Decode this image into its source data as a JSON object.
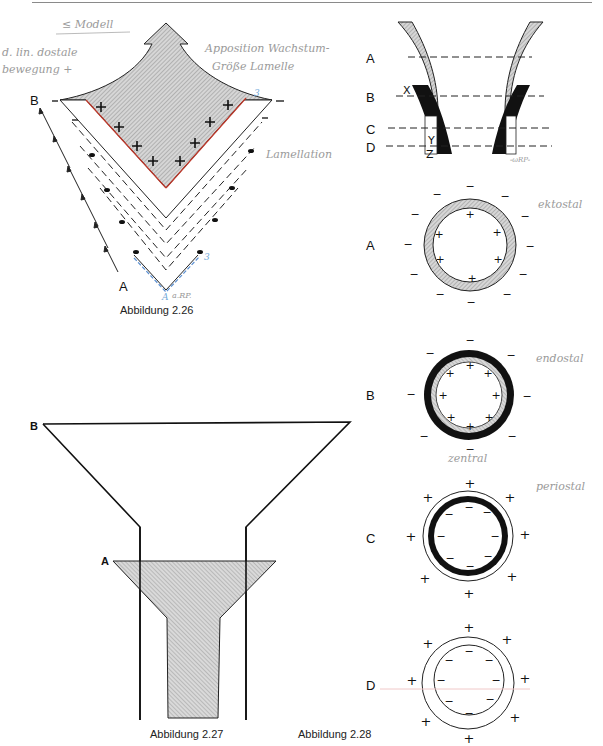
{
  "page": {
    "type": "textbook page scan with handwritten annotations"
  },
  "figure_2_26": {
    "caption": "Abbildung 2.26",
    "labels": {
      "top": "B",
      "bottom": "A"
    },
    "handwritten": {
      "title": "≤ Modell",
      "left_note_line1": "d. lin. dostale",
      "left_note_line2": "bewegung +",
      "right_note_line1": "Apposition Wachstum-",
      "right_note_line2": "Größe Lamelle",
      "side_note": "Lamellation",
      "blue_marks": [
        "3",
        "3",
        "A"
      ],
      "signature": "a.RP."
    },
    "inner_signs": [
      "+",
      "+",
      "+",
      "+",
      "+",
      "+",
      "+",
      "+",
      "+"
    ]
  },
  "figure_2_27": {
    "caption": "Abbildung 2.27",
    "labels": {
      "top": "B",
      "middle": "A"
    }
  },
  "figure_2_28": {
    "caption": "Abbildung 2.28",
    "section_labels": [
      "A",
      "B",
      "C",
      "D"
    ],
    "markers": [
      "X",
      "Y",
      "Z"
    ],
    "signature": "-ωRP-",
    "rings": [
      {
        "label": "A",
        "outer_sign": "−",
        "inner_sign": "+",
        "handwritten": "ektostal"
      },
      {
        "label": "B",
        "outer_sign": "−",
        "inner_sign": "+",
        "handwritten": "endostal"
      },
      {
        "label": "C",
        "outer_sign": "+",
        "inner_sign": "−",
        "handwritten": "periostal",
        "handwritten_above": "zentral"
      },
      {
        "label": "D",
        "outer_sign": "+",
        "inner_sign": "−"
      }
    ]
  }
}
